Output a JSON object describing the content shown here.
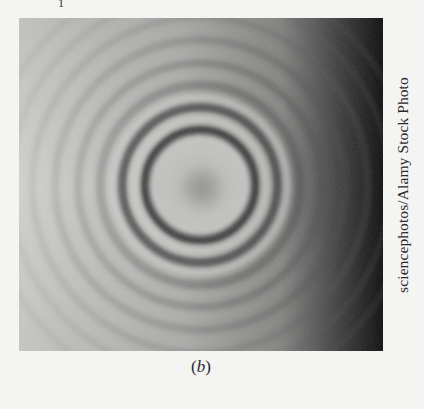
{
  "figure": {
    "top_partial_text": "1",
    "photo": {
      "subject": "circular interference ring pattern (Newton's rings)",
      "ring_center": [
        179,
        167
      ],
      "dark_ring_radii": [
        55,
        78,
        100,
        122,
        145,
        168,
        190,
        212
      ],
      "colors": {
        "light": "#c9c9c7",
        "mid": "#9b9b99",
        "dark": "#3a3a3a",
        "edge_dark": "#0e0e0e"
      }
    },
    "credit": "sciencephotos/Alamy Stock Photo",
    "caption_open": "(",
    "caption_letter": "b",
    "caption_close": ")"
  }
}
